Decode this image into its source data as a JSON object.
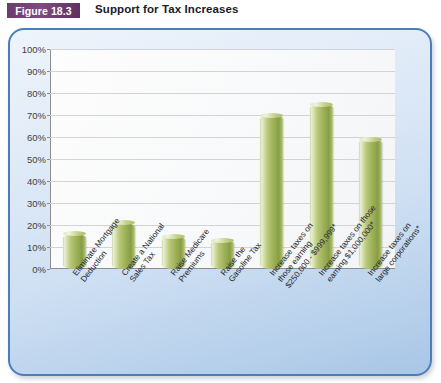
{
  "header": {
    "badge": "Figure 18.3",
    "title": "Support for Tax Increases"
  },
  "colors": {
    "badge": "#6b3a6e",
    "panel_border": "#4a7ebb",
    "panel_fill": "#cfe0f3",
    "bar_fill": "#9aae55",
    "bar_highlight": "#e9eed4",
    "gridline": "#d3d3d3",
    "axis": "#8d8d8d",
    "plot_background": "#fbfbfc",
    "label_text": "#23262e"
  },
  "chart_data": {
    "type": "bar",
    "title": "Support for Tax Increases",
    "xlabel": "",
    "ylabel": "",
    "ylim": [
      0,
      100
    ],
    "ytick_labels": [
      "100%",
      "90%",
      "80%",
      "70%",
      "60%",
      "50%",
      "40%",
      "30%",
      "20%",
      "10%",
      "0%"
    ],
    "ytick_values": [
      100,
      90,
      80,
      70,
      60,
      50,
      40,
      30,
      20,
      10,
      0
    ],
    "grid": true,
    "legend": "none",
    "categories": [
      "Eliminate Mortgage Deduction",
      "Create a National Sales Tax",
      "Raise Medicare Premiums",
      "Raise the Gasoline Tax",
      "Increase taxes on those earning $250,000 - $999,999*",
      "Increase taxes on those earning $1,000,000*",
      "Increase taxes on large corporations*"
    ],
    "category_lines": [
      [
        "Eliminate Mortgage",
        "Deduction"
      ],
      [
        "Create a National",
        "Sales Tax"
      ],
      [
        "Raise Medicare",
        "Premiums"
      ],
      [
        "Raise the",
        "Gasoline Tax"
      ],
      [
        "Increase taxes on",
        "those earning",
        "$250,000 - $999,999*"
      ],
      [
        "Increase taxes on those",
        "earning $1,000,000*"
      ],
      [
        "Increase taxes on",
        "large corporations*"
      ]
    ],
    "values": [
      16,
      21,
      15,
      13,
      70,
      75,
      59
    ]
  }
}
